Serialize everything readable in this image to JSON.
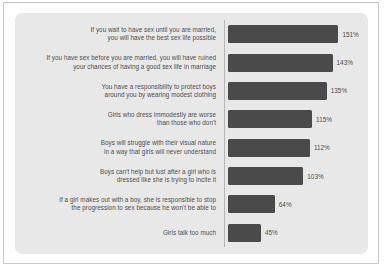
{
  "chart": {
    "type": "bar",
    "orientation": "horizontal",
    "title": "",
    "xlabel": "",
    "ylabel": "",
    "grid": false,
    "legend": null,
    "value_suffix": "%",
    "axis_spine": "left",
    "colors": {
      "bar": "#4a4a4a",
      "panel_background": "#e8e8e8",
      "page_background": "#ffffff",
      "frame_border": "#c9c9c9",
      "axis_line": "#b6b6b6",
      "label_text": "#4d4d4d"
    },
    "xlim": [
      0,
      160
    ],
    "categories": [
      "If you wait to have sex until you are married,\nyou will have the best sex life possible",
      "If you have sex before you are married, you will have ruined\nyour chances of having a good sex life in marriage",
      "You have a responsibility to protect boys\naround you by wearing modest clothing",
      "Girls who dress immodestly are worse\nthan those who don't",
      "Boys will struggle with their visual nature\nin a way that girls will never understand",
      "Boys can't help but lust after a girl who is\ndressed like she is trying to incite it",
      "If a girl makes out with a boy, she is responsible to stop\nthe progression to sex because he won't be able to",
      "Girls talk too much"
    ],
    "values": [
      151,
      143,
      135,
      115,
      112,
      103,
      64,
      45
    ],
    "value_labels": [
      "151%",
      "143%",
      "135%",
      "115%",
      "112%",
      "103%",
      "64%",
      "45%"
    ]
  }
}
